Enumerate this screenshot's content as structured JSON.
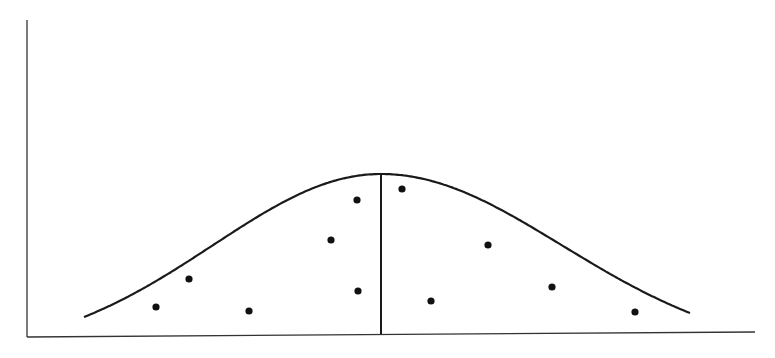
{
  "diagram": {
    "type": "bell-curve-with-scatter",
    "colors": {
      "background": "#ffffff",
      "ink": "#1a1a1a",
      "axis": "#333333"
    },
    "axes": {
      "y_axis": {
        "x": 27,
        "y1": 20,
        "y2": 337
      },
      "x_axis": {
        "x1": 27,
        "y1": 337,
        "x2": 755,
        "y2": 332
      }
    },
    "curve": {
      "start": [
        84,
        317
      ],
      "peak": [
        381,
        174
      ],
      "end": [
        690,
        313
      ]
    },
    "center_line": {
      "x": 381,
      "y1": 174,
      "y2": 334
    },
    "points": [
      [
        156,
        307
      ],
      [
        189,
        279
      ],
      [
        249,
        311
      ],
      [
        331,
        240
      ],
      [
        357,
        200
      ],
      [
        358,
        291
      ],
      [
        402,
        189
      ],
      [
        431,
        301
      ],
      [
        488,
        245
      ],
      [
        552,
        287
      ],
      [
        635,
        312
      ]
    ]
  }
}
